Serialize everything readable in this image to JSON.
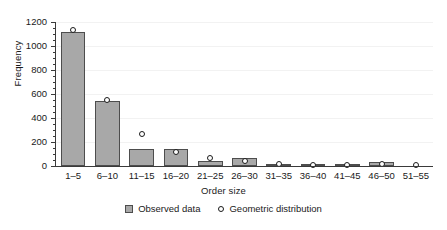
{
  "chart_data": {
    "type": "bar",
    "title": "",
    "xlabel": "Order size",
    "ylabel": "Frequency",
    "categories": [
      "1–5",
      "6–10",
      "11–15",
      "16–20",
      "21–25",
      "26–30",
      "31–35",
      "36–40",
      "41–45",
      "46–50",
      "51–55"
    ],
    "ylim": [
      0,
      1200
    ],
    "yticks": [
      0,
      200,
      400,
      600,
      800,
      1000,
      1200
    ],
    "ytick_labels": [
      "0",
      "200",
      "400",
      "600",
      "800",
      "1000",
      "1200"
    ],
    "yminor_step": 50,
    "grid": false,
    "legend_position": "bottom-center",
    "series": [
      {
        "name": "Observed data",
        "kind": "bar",
        "color": "#a8a8a8",
        "edge_color": "#4d4d4d",
        "values": [
          1120,
          540,
          145,
          145,
          40,
          65,
          12,
          8,
          2,
          35,
          0
        ]
      },
      {
        "name": "Geometric distribution",
        "kind": "marker",
        "marker": "open-circle",
        "color": "#1a1a1a",
        "values": [
          1130,
          550,
          270,
          120,
          65,
          40,
          14,
          8,
          5,
          15,
          5
        ]
      }
    ]
  },
  "legend": {
    "items": [
      {
        "label": "Observed data",
        "swatch": "filled-square-icon"
      },
      {
        "label": "Geometric distribution",
        "swatch": "open-circle-icon"
      }
    ]
  }
}
